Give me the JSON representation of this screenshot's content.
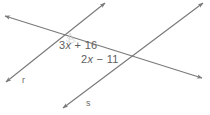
{
  "figure": {
    "width": 210,
    "height": 115,
    "background_color": "#ffffff",
    "line_color": "#7a7a7a",
    "text_color": "#5e5e5e"
  },
  "labels": {
    "angle_upper": {
      "full_text": "3x + 16",
      "coefficient": "3",
      "variable": "x",
      "operator": "+",
      "constant": "16"
    },
    "angle_lower": {
      "full_text": "2x − 11",
      "coefficient": "2",
      "variable": "x",
      "operator": "−",
      "constant": "11"
    },
    "line_r": "r",
    "line_s": "s"
  },
  "geometry": {
    "transversal": {
      "name": "transversal",
      "start": [
        5,
        16
      ],
      "end": [
        202,
        78
      ],
      "arrows": "both"
    },
    "line_r": {
      "name": "r",
      "start": [
        6,
        82
      ],
      "end": [
        105,
        3
      ],
      "arrows": "both"
    },
    "line_s": {
      "name": "s",
      "start": [
        63,
        108
      ],
      "end": [
        203,
        3
      ],
      "arrows": "both"
    },
    "intersections": [
      {
        "name": "transversal-r",
        "point": [
          70,
          32
        ]
      },
      {
        "name": "transversal-s",
        "point": [
          135,
          58
        ]
      }
    ]
  }
}
